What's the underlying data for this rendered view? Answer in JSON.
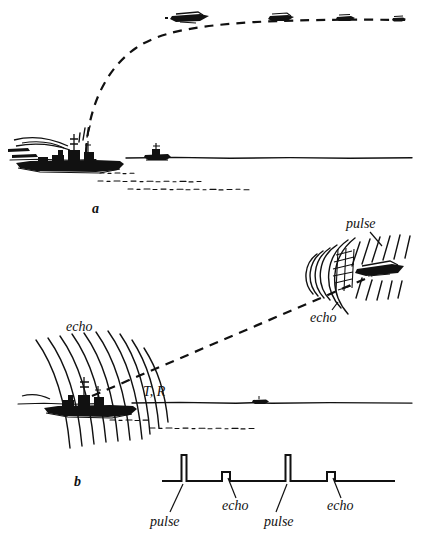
{
  "figure": {
    "background_color": "#ffffff",
    "ink_color": "#111111",
    "width": 422,
    "height": 541
  },
  "panels": [
    {
      "id": "a",
      "label": "a",
      "label_x": 92,
      "label_y": 213,
      "caption_role": "panel-label",
      "description": "Warship firing a shell along a dashed ballistic trajectory toward a distant aircraft; a second small ship sits on the horizon.",
      "horizon_y": 158,
      "objects": [
        {
          "name": "warship",
          "x": 10,
          "y": 135,
          "width": 115,
          "height": 45
        },
        {
          "name": "distant-ship",
          "x": 145,
          "y": 148,
          "width": 26,
          "height": 12
        },
        {
          "name": "aircraft-near",
          "x": 168,
          "y": 12,
          "width": 42,
          "height": 12
        },
        {
          "name": "aircraft-mid",
          "x": 268,
          "y": 14,
          "width": 26,
          "height": 10
        },
        {
          "name": "aircraft-far",
          "x": 335,
          "y": 14,
          "width": 20,
          "height": 8
        },
        {
          "name": "aircraft-farthest",
          "x": 392,
          "y": 16,
          "width": 14,
          "height": 7
        }
      ]
    },
    {
      "id": "b",
      "label": "b",
      "label_x": 74,
      "label_y": 486,
      "caption_role": "panel-label",
      "description": "Warship transmitting radar pulses that strike an aircraft and return as echoes; below, the time-base trace shows alternating pulse and echo blips.",
      "horizon_y": 403,
      "objects": [
        {
          "name": "warship",
          "x": 18,
          "y": 380,
          "width": 115,
          "height": 45
        },
        {
          "name": "distant-ship",
          "x": 253,
          "y": 398,
          "width": 16,
          "height": 8
        },
        {
          "name": "aircraft-target",
          "x": 355,
          "y": 262,
          "width": 54,
          "height": 16
        }
      ]
    }
  ],
  "annotations": [
    {
      "name": "echo-label-ship",
      "text": "echo",
      "x": 66,
      "y": 331,
      "panel": "b"
    },
    {
      "name": "pulse-label-aircraft",
      "text": "pulse",
      "x": 346,
      "y": 228,
      "panel": "b"
    },
    {
      "name": "echo-label-aircraft",
      "text": "echo",
      "x": 310,
      "y": 322,
      "panel": "b"
    },
    {
      "name": "transmitter-receiver-label",
      "text": "T, R",
      "x": 143,
      "y": 396,
      "panel": "b"
    }
  ],
  "chart_data": {
    "type": "line",
    "name": "radar-time-base-trace",
    "title": "",
    "xlabel": "",
    "ylabel": "",
    "baseline_y": 481,
    "trace_start_x": 162,
    "trace_end_x": 395,
    "grid": false,
    "legend": "none",
    "x": [
      184,
      226,
      288,
      331
    ],
    "values": [
      26,
      9,
      26,
      9
    ],
    "categories": [
      "pulse",
      "echo",
      "pulse",
      "echo"
    ],
    "blips": [
      {
        "label": "pulse",
        "x": 184,
        "height": 26,
        "width": 5,
        "label_x": 150,
        "label_y": 526,
        "leader_from_x": 183,
        "leader_from_y": 484,
        "leader_to_x": 170,
        "leader_to_y": 512
      },
      {
        "label": "echo",
        "x": 226,
        "height": 9,
        "width": 8,
        "label_x": 222,
        "label_y": 510,
        "leader_from_x": 228,
        "leader_from_y": 478,
        "leader_to_x": 236,
        "leader_to_y": 498
      },
      {
        "label": "pulse",
        "x": 288,
        "height": 26,
        "width": 5,
        "label_x": 264,
        "label_y": 526,
        "leader_from_x": 287,
        "leader_from_y": 484,
        "leader_to_x": 276,
        "leader_to_y": 512
      },
      {
        "label": "echo",
        "x": 331,
        "height": 9,
        "width": 8,
        "label_x": 327,
        "label_y": 510,
        "leader_from_x": 333,
        "leader_from_y": 478,
        "leader_to_x": 341,
        "leader_to_y": 498
      }
    ]
  }
}
